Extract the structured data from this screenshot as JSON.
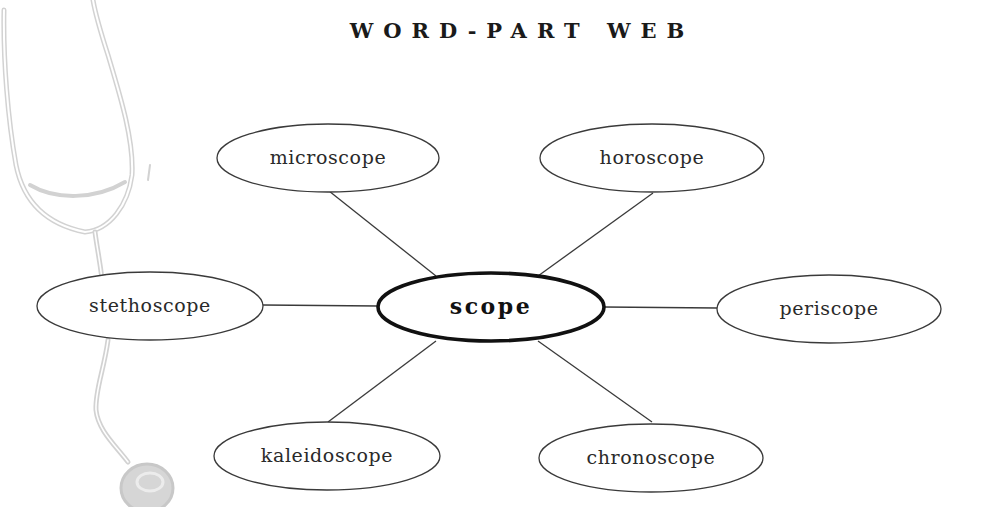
{
  "title": "WORD-PART WEB",
  "colors": {
    "line": "#3a3a3a",
    "center_stroke": "#111111",
    "illustration": "#cfcfcf",
    "background": "#ffffff"
  },
  "illustration": {
    "name": "stethoscope",
    "position": "left-edge",
    "style": "faded line drawing"
  },
  "center": {
    "label": "scope",
    "cx": 491,
    "cy": 307,
    "rx": 113,
    "ry": 34
  },
  "nodes": [
    {
      "id": "microscope",
      "label": "microscope",
      "cx": 328,
      "cy": 158,
      "rx": 111,
      "ry": 34,
      "line": [
        329,
        191,
        436,
        276
      ]
    },
    {
      "id": "horoscope",
      "label": "horoscope",
      "cx": 652,
      "cy": 158,
      "rx": 112,
      "ry": 34,
      "line": [
        653,
        193,
        538,
        276
      ]
    },
    {
      "id": "stethoscope",
      "label": "stethoscope",
      "cx": 150,
      "cy": 306,
      "rx": 113,
      "ry": 34,
      "line": [
        263,
        305,
        378,
        306
      ]
    },
    {
      "id": "periscope",
      "label": "periscope",
      "cx": 829,
      "cy": 309,
      "rx": 112,
      "ry": 34,
      "line": [
        604,
        307,
        717,
        308
      ]
    },
    {
      "id": "kaleidoscope",
      "label": "kaleidoscope",
      "cx": 327,
      "cy": 456,
      "rx": 113,
      "ry": 34,
      "line": [
        436,
        341,
        328,
        422
      ]
    },
    {
      "id": "chronoscope",
      "label": "chronoscope",
      "cx": 651,
      "cy": 458,
      "rx": 112,
      "ry": 34,
      "line": [
        538,
        341,
        652,
        422
      ]
    }
  ]
}
